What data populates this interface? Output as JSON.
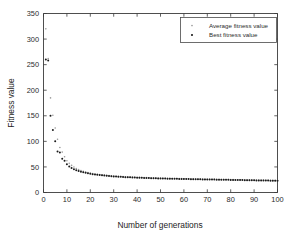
{
  "chart_data": {
    "type": "scatter",
    "title": "",
    "xlabel": "Number of generations",
    "ylabel": "Fitness value",
    "xlim": [
      0,
      100
    ],
    "ylim": [
      0,
      350
    ],
    "xticks": [
      0,
      10,
      20,
      30,
      40,
      50,
      60,
      70,
      80,
      90,
      100
    ],
    "yticks": [
      0,
      50,
      100,
      150,
      200,
      250,
      300,
      350
    ],
    "grid": false,
    "legend_position": "upper-right",
    "marker_style": "dot",
    "series": [
      {
        "name": "Average fitness value",
        "marker": "dot",
        "color": "#9a9a9a",
        "x": [
          1,
          2,
          3,
          4,
          5,
          6,
          7,
          8,
          9,
          10,
          11,
          12,
          13,
          14,
          15,
          16,
          17,
          18,
          19,
          20,
          21,
          22,
          23,
          24,
          25,
          26,
          27,
          28,
          29,
          30,
          31,
          32,
          33,
          34,
          35,
          36,
          37,
          38,
          39,
          40,
          41,
          42,
          43,
          44,
          45,
          46,
          47,
          48,
          49,
          50,
          51,
          52,
          53,
          54,
          55,
          56,
          57,
          58,
          59,
          60,
          61,
          62,
          63,
          64,
          65,
          66,
          67,
          68,
          69,
          70,
          71,
          72,
          73,
          74,
          75,
          76,
          77,
          78,
          79,
          80,
          81,
          82,
          83,
          84,
          85,
          86,
          87,
          88,
          89,
          90,
          91,
          92,
          93,
          94,
          95,
          96,
          97,
          98,
          99,
          100
        ],
        "values": [
          320,
          262,
          185,
          151,
          126,
          104,
          88,
          79,
          70,
          62,
          57,
          53,
          50,
          47,
          45,
          43,
          41.5,
          40,
          39,
          38,
          37,
          36.2,
          35.5,
          35,
          34.4,
          34,
          33.5,
          33,
          32.6,
          32.2,
          31.9,
          31.6,
          31.3,
          31,
          30.8,
          30.5,
          30.3,
          30.1,
          29.9,
          29.7,
          29.5,
          29.3,
          29.1,
          29,
          28.8,
          28.7,
          28.5,
          28.4,
          28.2,
          28.1,
          28,
          27.9,
          27.7,
          27.6,
          27.5,
          27.4,
          27.3,
          27.2,
          27.1,
          27,
          26.9,
          26.8,
          26.7,
          26.6,
          26.5,
          26.4,
          26.3,
          26.2,
          26.1,
          26,
          25.9,
          25.8,
          25.8,
          25.7,
          25.6,
          25.5,
          25.4,
          25.4,
          25.3,
          25.2,
          25.1,
          25,
          25,
          24.9,
          24.8,
          24.7,
          24.7,
          24.6,
          24.5,
          24.4,
          24.3,
          24.3,
          24.2,
          24.1,
          24,
          24,
          23.9,
          23.8,
          23.7,
          23.6
        ]
      },
      {
        "name": "Best fitness value",
        "marker": "dot",
        "color": "#1a1a1a",
        "x": [
          1,
          2,
          3,
          4,
          5,
          6,
          7,
          8,
          9,
          10,
          11,
          12,
          13,
          14,
          15,
          16,
          17,
          18,
          19,
          20,
          21,
          22,
          23,
          24,
          25,
          26,
          27,
          28,
          29,
          30,
          31,
          32,
          33,
          34,
          35,
          36,
          37,
          38,
          39,
          40,
          41,
          42,
          43,
          44,
          45,
          46,
          47,
          48,
          49,
          50,
          51,
          52,
          53,
          54,
          55,
          56,
          57,
          58,
          59,
          60,
          61,
          62,
          63,
          64,
          65,
          66,
          67,
          68,
          69,
          70,
          71,
          72,
          73,
          74,
          75,
          76,
          77,
          78,
          79,
          80,
          81,
          82,
          83,
          84,
          85,
          86,
          87,
          88,
          89,
          90,
          91,
          92,
          93,
          94,
          95,
          96,
          97,
          98,
          99,
          100
        ],
        "values": [
          260,
          258,
          150,
          122,
          100,
          80,
          78,
          66,
          62,
          55,
          51,
          48,
          45.5,
          43.5,
          42,
          40.5,
          39.5,
          38.5,
          37.5,
          36.5,
          35.8,
          35.2,
          34.6,
          34,
          33.5,
          33,
          32.6,
          32.2,
          31.8,
          31.5,
          31.2,
          30.9,
          30.6,
          30.3,
          30,
          29.8,
          29.6,
          29.4,
          29.2,
          29,
          28.8,
          28.6,
          28.5,
          28.3,
          28.2,
          28,
          27.9,
          27.7,
          27.6,
          27.5,
          27.3,
          27.2,
          27.1,
          27,
          26.9,
          26.8,
          26.7,
          26.6,
          26.5,
          26.4,
          26.3,
          26.2,
          26.1,
          26,
          25.9,
          25.8,
          25.7,
          25.6,
          25.5,
          25.4,
          25.3,
          25.3,
          25.2,
          25.1,
          25,
          24.9,
          24.9,
          24.8,
          24.7,
          24.6,
          24.5,
          24.5,
          24.4,
          24.3,
          24.2,
          24.1,
          24.1,
          24,
          23.9,
          23.8,
          23.7,
          23.7,
          23.6,
          23.5,
          23.4,
          23.3,
          23.2,
          23.1,
          23,
          22.8
        ]
      }
    ]
  },
  "legend": {
    "entries": [
      {
        "label": "Average fitness value"
      },
      {
        "label": "Best fitness value"
      }
    ]
  }
}
